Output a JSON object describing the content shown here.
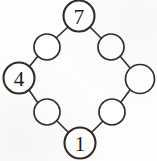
{
  "diagram": {
    "type": "cycle-graph",
    "shape": "diamond",
    "stroke_color": "#2e2c2b",
    "node_fill": "#ffffff",
    "background": "#fdfdfc",
    "node_count": 8,
    "edge_count": 8,
    "nodes": [
      {
        "id": "n-top",
        "label": "7",
        "cx": 79,
        "cy": 16,
        "r": 15.5,
        "major": true,
        "labeled": true
      },
      {
        "id": "n-upper-right",
        "label": "",
        "cx": 111,
        "cy": 47,
        "r": 13.0,
        "major": false,
        "labeled": false
      },
      {
        "id": "n-right",
        "label": "",
        "cx": 140,
        "cy": 79,
        "r": 14.5,
        "major": false,
        "labeled": false
      },
      {
        "id": "n-lower-right",
        "label": "",
        "cx": 112,
        "cy": 112,
        "r": 13.0,
        "major": false,
        "labeled": false
      },
      {
        "id": "n-bottom",
        "label": "1",
        "cx": 80,
        "cy": 143,
        "r": 15.5,
        "major": true,
        "labeled": true
      },
      {
        "id": "n-lower-left",
        "label": "",
        "cx": 47,
        "cy": 112,
        "r": 13.0,
        "major": false,
        "labeled": false
      },
      {
        "id": "n-left",
        "label": "4",
        "cx": 19,
        "cy": 78,
        "r": 15.5,
        "major": true,
        "labeled": true
      },
      {
        "id": "n-upper-left",
        "label": "",
        "cx": 47,
        "cy": 47,
        "r": 13.0,
        "major": false,
        "labeled": false
      }
    ],
    "edges": [
      {
        "from": "n-top",
        "to": "n-upper-right",
        "x1": 90,
        "y1": 27,
        "x2": 102,
        "y2": 39
      },
      {
        "from": "n-upper-right",
        "to": "n-right",
        "x1": 120,
        "y1": 56,
        "x2": 130,
        "y2": 68
      },
      {
        "from": "n-right",
        "to": "n-lower-right",
        "x1": 130,
        "y1": 90,
        "x2": 121,
        "y2": 102
      },
      {
        "from": "n-lower-right",
        "to": "n-bottom",
        "x1": 103,
        "y1": 121,
        "x2": 91,
        "y2": 133
      },
      {
        "from": "n-bottom",
        "to": "n-lower-left",
        "x1": 69,
        "y1": 133,
        "x2": 57,
        "y2": 121
      },
      {
        "from": "n-lower-left",
        "to": "n-left",
        "x1": 38,
        "y1": 103,
        "x2": 29,
        "y2": 90
      },
      {
        "from": "n-left",
        "to": "n-upper-left",
        "x1": 29,
        "y1": 67,
        "x2": 38,
        "y2": 56
      },
      {
        "from": "n-upper-left",
        "to": "n-top",
        "x1": 56,
        "y1": 38,
        "x2": 68,
        "y2": 27
      }
    ],
    "labels": {
      "top": "7",
      "left": "4",
      "bottom": "1"
    }
  }
}
